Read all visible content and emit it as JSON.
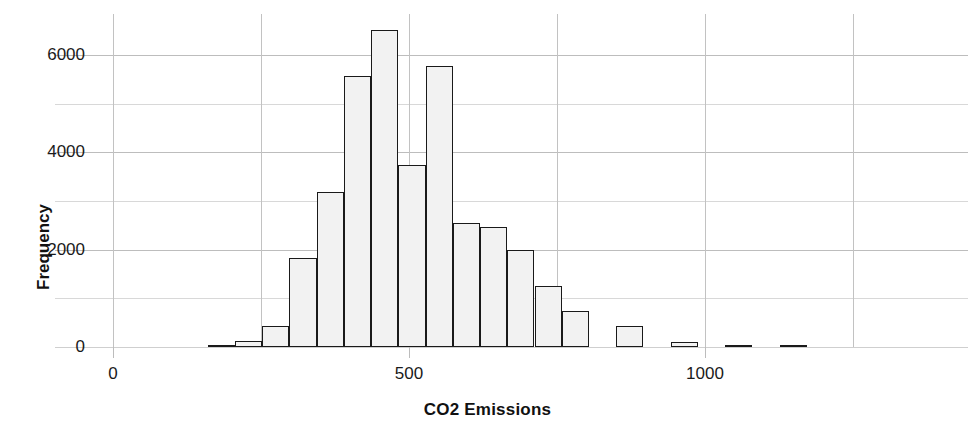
{
  "chart_data": {
    "type": "bar",
    "title": "",
    "subtitle": "",
    "xlabel": "CO2 Emissions",
    "ylabel": "Frequency",
    "xlim": [
      0,
      1300
    ],
    "ylim": [
      0,
      6800
    ],
    "xticks": [
      0,
      500,
      1000
    ],
    "xtick_labels": [
      "0",
      "500",
      "1000"
    ],
    "yticks": [
      0,
      2000,
      4000,
      6000
    ],
    "ytick_labels": [
      "0",
      "2000",
      "4000",
      "6000"
    ],
    "y_minor_gridlines": [
      1000,
      3000,
      5000
    ],
    "x_minor_gridlines": [
      250,
      750,
      1250
    ],
    "grid": true,
    "legend": null,
    "bin_width": 46,
    "bin_edges": [
      160,
      206,
      252,
      298,
      344,
      390,
      436,
      482,
      528,
      574,
      620,
      666,
      712,
      758,
      804,
      850,
      896,
      942,
      988,
      1034,
      1080,
      1126
    ],
    "bar_color": "#f2f2f2",
    "bar_edge_color": "#1a1a1a",
    "bins": [
      {
        "x0": 160,
        "x1": 206,
        "value": 20
      },
      {
        "x0": 206,
        "x1": 252,
        "value": 120
      },
      {
        "x0": 252,
        "x1": 298,
        "value": 430
      },
      {
        "x0": 298,
        "x1": 344,
        "value": 1820
      },
      {
        "x0": 344,
        "x1": 390,
        "value": 3190
      },
      {
        "x0": 390,
        "x1": 436,
        "value": 5560
      },
      {
        "x0": 436,
        "x1": 482,
        "value": 6520
      },
      {
        "x0": 482,
        "x1": 528,
        "value": 3750
      },
      {
        "x0": 528,
        "x1": 574,
        "value": 5780
      },
      {
        "x0": 574,
        "x1": 620,
        "value": 2550
      },
      {
        "x0": 620,
        "x1": 666,
        "value": 2470
      },
      {
        "x0": 666,
        "x1": 712,
        "value": 2000
      },
      {
        "x0": 712,
        "x1": 758,
        "value": 1260
      },
      {
        "x0": 758,
        "x1": 804,
        "value": 730
      },
      {
        "x0": 850,
        "x1": 896,
        "value": 430
      },
      {
        "x0": 942,
        "x1": 988,
        "value": 110
      },
      {
        "x0": 1034,
        "x1": 1080,
        "value": 30
      },
      {
        "x0": 1126,
        "x1": 1172,
        "value": 20
      }
    ]
  },
  "axes": {
    "x_title": "CO2 Emissions",
    "y_title": "Frequency"
  }
}
